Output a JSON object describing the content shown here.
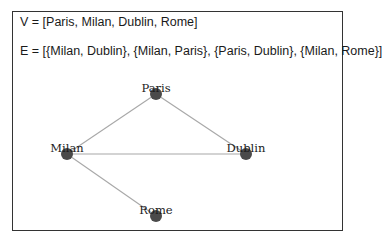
{
  "vertices_text": "V = [Paris, Milan, Dublin, Rome]",
  "edges_text": "E = [{Milan, Dublin}, {Milan, Paris}, {Paris, Dublin}, {Milan, Rome}]",
  "graph": {
    "nodes": [
      {
        "id": "Paris",
        "label": "Paris",
        "x": 156,
        "y": 94
      },
      {
        "id": "Milan",
        "label": "Milan",
        "x": 67,
        "y": 154
      },
      {
        "id": "Dublin",
        "label": "Dublin",
        "x": 246,
        "y": 154
      },
      {
        "id": "Rome",
        "label": "Rome",
        "x": 156,
        "y": 216
      }
    ],
    "edges": [
      [
        "Milan",
        "Dublin"
      ],
      [
        "Milan",
        "Paris"
      ],
      [
        "Paris",
        "Dublin"
      ],
      [
        "Milan",
        "Rome"
      ]
    ],
    "colors": {
      "node": "#4a4a4a",
      "edge": "#a8a8a8",
      "border": "#333333"
    }
  }
}
